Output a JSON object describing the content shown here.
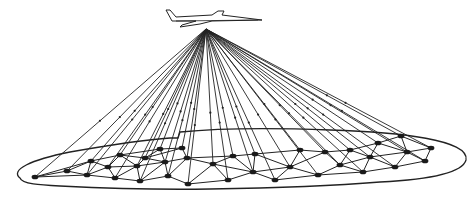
{
  "diagram": {
    "colors": {
      "background": "#ffffff",
      "stroke": "#222222",
      "node": "#1a1a1a"
    },
    "aircraft": {
      "x": 206,
      "y": 20
    },
    "ray_source": {
      "x": 206,
      "y": 29
    },
    "region_outline": "M 20 178 C 10 170, 30 160, 70 152 C 110 145, 140 140, 170 138 L 178 138 L 180 132 C 220 128, 280 128, 330 130 C 400 132, 470 140, 466 160 C 462 175, 420 180, 380 182 C 330 186, 270 188, 210 189 C 150 190, 100 188, 60 186 C 40 185, 22 184, 20 178 Z",
    "nodes": [
      {
        "id": 0,
        "x": 35,
        "y": 177
      },
      {
        "id": 1,
        "x": 67,
        "y": 171
      },
      {
        "id": 2,
        "x": 87,
        "y": 175
      },
      {
        "id": 3,
        "x": 91,
        "y": 161
      },
      {
        "id": 4,
        "x": 108,
        "y": 167
      },
      {
        "id": 5,
        "x": 115,
        "y": 178
      },
      {
        "id": 6,
        "x": 120,
        "y": 155
      },
      {
        "id": 7,
        "x": 137,
        "y": 166
      },
      {
        "id": 8,
        "x": 145,
        "y": 158
      },
      {
        "id": 9,
        "x": 140,
        "y": 181
      },
      {
        "id": 10,
        "x": 160,
        "y": 149
      },
      {
        "id": 11,
        "x": 165,
        "y": 162
      },
      {
        "id": 12,
        "x": 168,
        "y": 176
      },
      {
        "id": 13,
        "x": 182,
        "y": 148
      },
      {
        "id": 14,
        "x": 187,
        "y": 158
      },
      {
        "id": 15,
        "x": 188,
        "y": 184
      },
      {
        "id": 16,
        "x": 213,
        "y": 164
      },
      {
        "id": 17,
        "x": 228,
        "y": 180
      },
      {
        "id": 18,
        "x": 233,
        "y": 156
      },
      {
        "id": 19,
        "x": 253,
        "y": 172
      },
      {
        "id": 20,
        "x": 255,
        "y": 154
      },
      {
        "id": 21,
        "x": 275,
        "y": 180
      },
      {
        "id": 22,
        "x": 290,
        "y": 167
      },
      {
        "id": 23,
        "x": 300,
        "y": 150
      },
      {
        "id": 24,
        "x": 318,
        "y": 175
      },
      {
        "id": 25,
        "x": 325,
        "y": 152
      },
      {
        "id": 26,
        "x": 340,
        "y": 165
      },
      {
        "id": 27,
        "x": 350,
        "y": 150
      },
      {
        "id": 28,
        "x": 363,
        "y": 172
      },
      {
        "id": 29,
        "x": 370,
        "y": 157
      },
      {
        "id": 30,
        "x": 378,
        "y": 143
      },
      {
        "id": 31,
        "x": 395,
        "y": 167
      },
      {
        "id": 32,
        "x": 401,
        "y": 136
      },
      {
        "id": 33,
        "x": 407,
        "y": 152
      },
      {
        "id": 34,
        "x": 425,
        "y": 161
      },
      {
        "id": 35,
        "x": 431,
        "y": 148
      }
    ],
    "edges": [
      [
        0,
        1
      ],
      [
        0,
        2
      ],
      [
        0,
        3
      ],
      [
        1,
        2
      ],
      [
        1,
        3
      ],
      [
        2,
        3
      ],
      [
        2,
        4
      ],
      [
        2,
        5
      ],
      [
        3,
        4
      ],
      [
        3,
        6
      ],
      [
        4,
        5
      ],
      [
        4,
        6
      ],
      [
        4,
        7
      ],
      [
        5,
        7
      ],
      [
        5,
        9
      ],
      [
        6,
        7
      ],
      [
        6,
        8
      ],
      [
        6,
        10
      ],
      [
        7,
        8
      ],
      [
        7,
        9
      ],
      [
        7,
        11
      ],
      [
        8,
        10
      ],
      [
        8,
        11
      ],
      [
        8,
        13
      ],
      [
        9,
        11
      ],
      [
        9,
        12
      ],
      [
        10,
        13
      ],
      [
        10,
        11
      ],
      [
        11,
        12
      ],
      [
        11,
        14
      ],
      [
        12,
        14
      ],
      [
        12,
        15
      ],
      [
        13,
        14
      ],
      [
        14,
        16
      ],
      [
        14,
        18
      ],
      [
        15,
        16
      ],
      [
        15,
        17
      ],
      [
        16,
        17
      ],
      [
        16,
        18
      ],
      [
        16,
        19
      ],
      [
        17,
        19
      ],
      [
        18,
        19
      ],
      [
        18,
        20
      ],
      [
        19,
        20
      ],
      [
        19,
        21
      ],
      [
        19,
        22
      ],
      [
        20,
        22
      ],
      [
        20,
        23
      ],
      [
        21,
        22
      ],
      [
        21,
        24
      ],
      [
        22,
        23
      ],
      [
        22,
        24
      ],
      [
        22,
        25
      ],
      [
        23,
        25
      ],
      [
        24,
        26
      ],
      [
        24,
        28
      ],
      [
        25,
        26
      ],
      [
        25,
        27
      ],
      [
        26,
        27
      ],
      [
        26,
        28
      ],
      [
        26,
        29
      ],
      [
        27,
        29
      ],
      [
        27,
        30
      ],
      [
        28,
        29
      ],
      [
        28,
        31
      ],
      [
        29,
        30
      ],
      [
        29,
        31
      ],
      [
        29,
        33
      ],
      [
        30,
        32
      ],
      [
        30,
        33
      ],
      [
        31,
        33
      ],
      [
        31,
        34
      ],
      [
        32,
        33
      ],
      [
        32,
        35
      ],
      [
        33,
        34
      ],
      [
        33,
        35
      ],
      [
        34,
        35
      ]
    ]
  }
}
